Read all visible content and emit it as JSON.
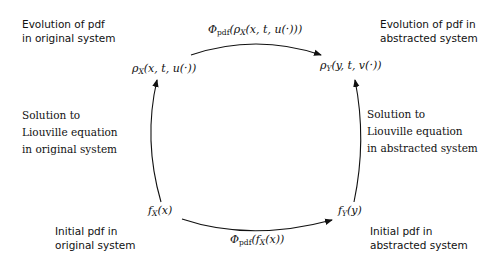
{
  "diagram": {
    "nodes": {
      "rho_x": {
        "base": "ρ",
        "sub": "X",
        "args": "(x, t, u(·))"
      },
      "rho_y": {
        "base": "ρ",
        "sub": "Y",
        "args": "(y, t, v(·))"
      },
      "f_x": {
        "base": "f",
        "sub": "X",
        "args": "(x)"
      },
      "f_y": {
        "base": "f",
        "sub": "Y",
        "args": "(y)"
      }
    },
    "edges": {
      "top": {
        "base": "Φ",
        "sub": "pdf",
        "args": "(ρ",
        "inner_sub": "X",
        "tail": "(x, t, u(·)))"
      },
      "bottom": {
        "base": "Φ",
        "sub": "pdf",
        "args": "(f",
        "inner_sub": "X",
        "tail": "(x))"
      }
    },
    "labels": {
      "top_left": [
        "Evolution of pdf",
        "in original system"
      ],
      "top_right": [
        "Evolution of pdf in",
        "abstracted system"
      ],
      "mid_left": [
        "Solution to",
        "Liouville equation",
        "in original system"
      ],
      "mid_right": [
        "Solution to",
        "Liouville equation",
        "in abstracted system"
      ],
      "bottom_left": [
        "Initial pdf in",
        "original system"
      ],
      "bottom_right": [
        "Initial pdf in",
        "abstracted system"
      ]
    },
    "colors": {
      "stroke": "#111111",
      "background": "#ffffff"
    }
  }
}
